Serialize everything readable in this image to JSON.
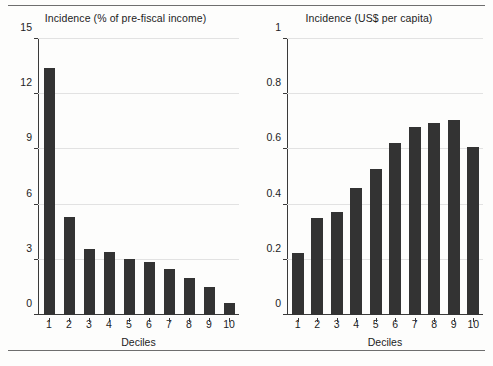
{
  "figure": {
    "background_color": "#fdfdfc",
    "bar_color": "#333333",
    "grid_color": "#e2e2e2",
    "axis_color": "#3a3a3a",
    "rule_top": "horizontal-rule",
    "rule_bottom": "horizontal-rule"
  },
  "chart_data": [
    {
      "type": "bar",
      "title": "Incidence (% of pre-fiscal income)",
      "xlabel": "Deciles",
      "ylabel": "",
      "categories": [
        "1",
        "2",
        "3",
        "4",
        "5",
        "6",
        "7",
        "8",
        "9",
        "10"
      ],
      "values": [
        13.4,
        5.3,
        3.6,
        3.4,
        3.05,
        2.9,
        2.5,
        2.0,
        1.5,
        0.65
      ],
      "ylim": [
        0,
        15
      ],
      "yticks": [
        0,
        3,
        6,
        9,
        12,
        15
      ],
      "ytick_labels": [
        "0",
        "3",
        "6",
        "9",
        "12",
        "15"
      ],
      "grid": true,
      "legend": "none",
      "position": "left"
    },
    {
      "type": "bar",
      "title": "Incidence (US$ per capita)",
      "xlabel": "Deciles",
      "ylabel": "",
      "categories": [
        "1",
        "2",
        "3",
        "4",
        "5",
        "6",
        "7",
        "8",
        "9",
        "10"
      ],
      "values": [
        0.225,
        0.35,
        0.375,
        0.46,
        0.53,
        0.625,
        0.68,
        0.695,
        0.705,
        0.61
      ],
      "ylim": [
        0,
        1
      ],
      "yticks": [
        0,
        0.2,
        0.4,
        0.6,
        0.8,
        1
      ],
      "ytick_labels": [
        "0",
        "0.2",
        "0.4",
        "0.6",
        "0.8",
        "1"
      ],
      "grid": true,
      "legend": "none",
      "position": "right"
    }
  ]
}
